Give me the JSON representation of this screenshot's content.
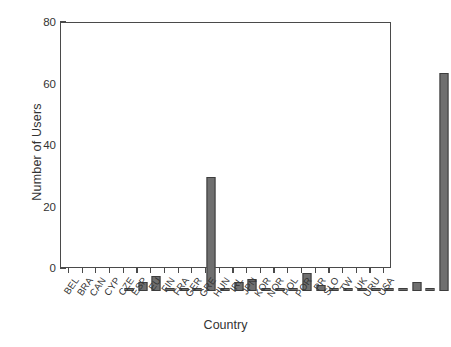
{
  "chart_data": {
    "type": "bar",
    "title": "",
    "xlabel": "Country",
    "ylabel": "Number of Users",
    "categories": [
      "BEL",
      "BRA",
      "CAN",
      "CYP",
      "CZE",
      "ESP",
      "EU",
      "FIN",
      "FRA",
      "GER",
      "GRE",
      "HUN",
      "IRL",
      "JPN",
      "KOR",
      "NOR",
      "POL",
      "POR",
      "PR",
      "SLO",
      "TW",
      "UK",
      "URU",
      "USA"
    ],
    "values": [
      1,
      3,
      5,
      1,
      1,
      1,
      37,
      1,
      3,
      4,
      1,
      1,
      1,
      6,
      2,
      1,
      1,
      1,
      1,
      1,
      1,
      3,
      1,
      71
    ],
    "ylim": [
      0,
      80
    ],
    "y_ticks": [
      0,
      20,
      40,
      60,
      80
    ],
    "y_tick_labels": [
      "0",
      "20",
      "40",
      "60",
      "80"
    ],
    "y_minor_tick_interval": 10,
    "grid": false,
    "legend": false,
    "bar_color": "#6f6f6f",
    "bar_edge_color": "#3d3d3d",
    "axis_color": "#4a4a4a",
    "background_color": "#ffffff"
  }
}
